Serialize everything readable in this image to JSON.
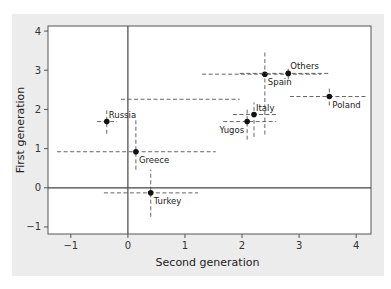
{
  "chart_data": {
    "type": "scatter",
    "title": "",
    "xlabel": "Second generation",
    "ylabel": "First generation",
    "xlim": [
      -1.4,
      4.26
    ],
    "ylim": [
      -1.18,
      4.13
    ],
    "xticks": [
      -1,
      0,
      1,
      2,
      3,
      4
    ],
    "yticks": [
      -1,
      0,
      1,
      2,
      3,
      4
    ],
    "grid": false,
    "reference_lines": {
      "x": 0,
      "y": 0
    },
    "points": [
      {
        "label": "Russia",
        "x": -0.37,
        "y": 1.69,
        "xerr": [
          -0.54,
          -0.19
        ],
        "yerr": [
          1.38,
          2.0
        ],
        "label_pos": "above-right"
      },
      {
        "label": "Greece",
        "x": 0.14,
        "y": 0.92,
        "xerr": [
          -1.24,
          1.54
        ],
        "yerr": [
          0.46,
          1.72
        ],
        "label_pos": "below-right"
      },
      {
        "label": "Turkey",
        "x": 0.4,
        "y": -0.13,
        "xerr": [
          -0.42,
          1.23
        ],
        "yerr": [
          -0.74,
          0.46
        ],
        "label_pos": "below-right"
      },
      {
        "label": "Spain",
        "x": 2.4,
        "y": 2.9,
        "xerr": [
          1.3,
          3.39
        ],
        "yerr": [
          1.36,
          3.49
        ],
        "label_pos": "below-right"
      },
      {
        "label": "Others",
        "x": 2.81,
        "y": 2.92,
        "xerr": [
          1.96,
          3.51
        ],
        "yerr": [
          2.77,
          3.08
        ],
        "label_pos": "above-right"
      },
      {
        "label": "Poland",
        "x": 3.53,
        "y": 2.33,
        "xerr": [
          2.84,
          4.18
        ],
        "yerr": [
          2.1,
          2.56
        ],
        "label_pos": "below-right"
      },
      {
        "label": "Italy",
        "x": 2.21,
        "y": 1.87,
        "xerr": [
          1.84,
          2.6
        ],
        "yerr": [
          1.3,
          2.18
        ],
        "label_pos": "above-right"
      },
      {
        "label": "Yugos",
        "x": 2.09,
        "y": 1.69,
        "xerr": [
          1.67,
          2.6
        ],
        "yerr": [
          1.23,
          2.0
        ],
        "label_pos": "below-left"
      }
    ],
    "extra_segments": [
      {
        "orientation": "horizontal",
        "y": 2.26,
        "x_from": -0.12,
        "x_to": 1.96
      }
    ]
  }
}
